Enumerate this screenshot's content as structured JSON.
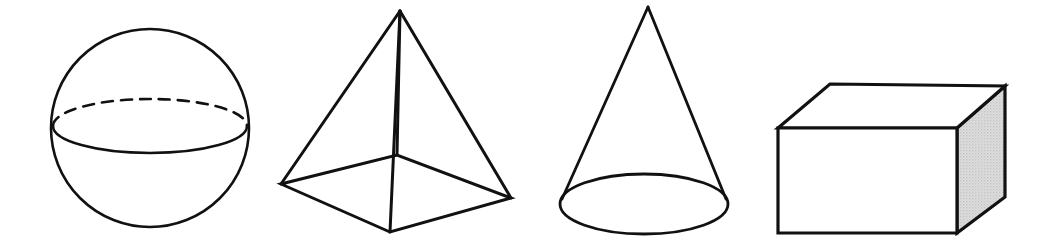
{
  "figure": {
    "background_color": "#ffffff",
    "line_color": "#111111",
    "width": 1058,
    "height": 248,
    "shading_color": "#d8d8d8",
    "shapes": [
      {
        "id": "sphere",
        "name": "Sphere",
        "type": "sphere",
        "label": "sphere",
        "center": [
          150,
          128
        ],
        "radius": 99,
        "stroke_width": 2.6,
        "equator": {
          "center": [
            150,
            126
          ],
          "rx": 97,
          "ry": 27,
          "back_half_style": "dashed",
          "front_half_style": "solid",
          "dash_pattern": "11 8",
          "stroke_width": 2.6
        }
      },
      {
        "id": "pyramid",
        "name": "Square Pyramid",
        "type": "pyramid",
        "label": "square pyramid",
        "apex": [
          400,
          11
        ],
        "base_vertices": {
          "left": [
            281,
            184
          ],
          "front": [
            390,
            232
          ],
          "right": [
            511,
            198
          ],
          "back": [
            397,
            155
          ]
        },
        "edge_style": "solid",
        "stroke_width": 3.0
      },
      {
        "id": "cone",
        "name": "Cone",
        "type": "cone",
        "label": "cone",
        "apex": [
          648,
          7
        ],
        "base_ellipse": {
          "center": [
            644,
            204
          ],
          "rx": 84,
          "ry": 30,
          "style": "solid"
        },
        "slant_contact_left": [
          562,
          199
        ],
        "slant_contact_right": [
          726,
          199
        ],
        "stroke_width": 2.8
      },
      {
        "id": "box",
        "name": "Rectangular Box",
        "type": "cuboid",
        "label": "rectangular prism",
        "front_face": [
          [
            778,
            128
          ],
          [
            957,
            128
          ],
          [
            957,
            233
          ],
          [
            778,
            233
          ]
        ],
        "top_face": [
          [
            778,
            128
          ],
          [
            830,
            84
          ],
          [
            1005,
            86
          ],
          [
            957,
            128
          ]
        ],
        "right_face": [
          [
            957,
            128
          ],
          [
            1005,
            86
          ],
          [
            1005,
            197
          ],
          [
            957,
            233
          ]
        ],
        "right_face_fill": "#d8d8d8",
        "front_face_fill": "#ffffff",
        "top_face_fill": "#ffffff",
        "stroke_width": 3.2
      }
    ]
  }
}
